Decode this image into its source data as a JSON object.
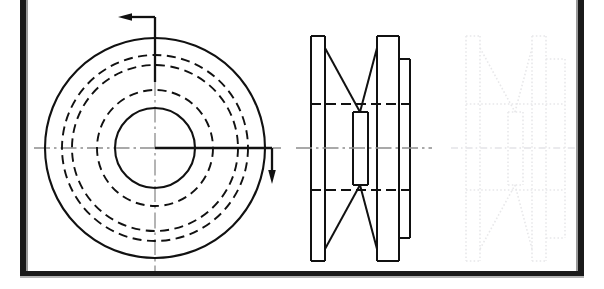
{
  "document": {
    "type": "engineering-drawing",
    "subject": "V-belt pulley (grooved sheave)",
    "projection": "first-angle orthographic",
    "background_color": "#ffffff",
    "line_color": "#111111",
    "center_line_color": "#8d8d8d",
    "ghost_line_color": "#e8e8ea",
    "frame_color": "#1a1a1a"
  },
  "frame": {
    "left_bar": {
      "x": 20,
      "y": 0,
      "width": 6,
      "height": 289
    },
    "right_bar": {
      "x": 578,
      "y": 0,
      "width": 6,
      "height": 289
    },
    "bottom_bar": {
      "x": 20,
      "y": 272,
      "width": 564,
      "height": 5
    },
    "inner_left_line": {
      "x": 27,
      "y": 0,
      "height": 275
    },
    "inner_right_line": {
      "x": 577,
      "y": 0,
      "height": 275
    }
  },
  "views": {
    "front_view": {
      "name": "Front view - concentric circles",
      "center": {
        "x": 155,
        "y": 148
      },
      "circles": [
        {
          "name": "outer-rim-circle",
          "radius": 110,
          "style": "solid",
          "stroke_width": 2.1
        },
        {
          "name": "groove-outer-dashed",
          "radius": 93,
          "style": "dashed",
          "stroke_width": 1.9
        },
        {
          "name": "groove-inner-dashed",
          "radius": 83,
          "style": "dashed",
          "stroke_width": 1.9
        },
        {
          "name": "hub-outer-dashed",
          "radius": 58,
          "style": "dashed",
          "stroke_width": 1.9
        },
        {
          "name": "bore-circle",
          "radius": 40,
          "style": "solid",
          "stroke_width": 2.1
        }
      ],
      "center_lines": {
        "horizontal": {
          "x1": 34,
          "x2": 281,
          "y": 148
        },
        "vertical": {
          "y1": 27,
          "y2": 272,
          "x": 155
        }
      }
    },
    "section_view": {
      "name": "Side sectional view of pulley",
      "center_y": 148,
      "vertical_edges_x": [
        311,
        325,
        360,
        377,
        399,
        410
      ],
      "outer_flange_top": 36,
      "outer_flange_bottom": 261,
      "hub_top": 82,
      "hub_bottom": 215,
      "boss_top": 59,
      "boss_bottom": 238,
      "hidden_lines_y": [
        104,
        190
      ],
      "center_line": {
        "x1": 296,
        "x2": 432,
        "y": 148
      }
    },
    "ghost_view": {
      "name": "Ghosted duplicate side view (faded construction)",
      "center_y": 148,
      "vertical_edges_x": [
        466,
        480,
        515,
        532,
        554,
        565
      ],
      "outer_flange_top": 36,
      "outer_flange_bottom": 261,
      "hub_top": 82,
      "hub_bottom": 215,
      "boss_top": 59,
      "boss_bottom": 238,
      "hidden_lines_y": [
        104,
        190
      ],
      "center_line": {
        "x1": 451,
        "x2": 578,
        "y": 148
      }
    }
  },
  "annotations": {
    "section_arrow_top": {
      "name": "section-arrow-top",
      "direction": "left",
      "leader_vertical": {
        "x": 155,
        "y1": 17,
        "y2": 80
      },
      "leader_horizontal": {
        "y": 17,
        "x1": 122,
        "x2": 155
      },
      "arrow_tip": {
        "x": 120,
        "y": 17
      }
    },
    "section_arrow_right": {
      "name": "section-arrow-right",
      "direction": "down",
      "leader_horizontal": {
        "y": 148,
        "x1": 155,
        "x2": 272
      },
      "leader_vertical": {
        "x": 272,
        "y1": 148,
        "y2": 180
      },
      "arrow_tip": {
        "x": 272,
        "y": 183
      }
    }
  }
}
